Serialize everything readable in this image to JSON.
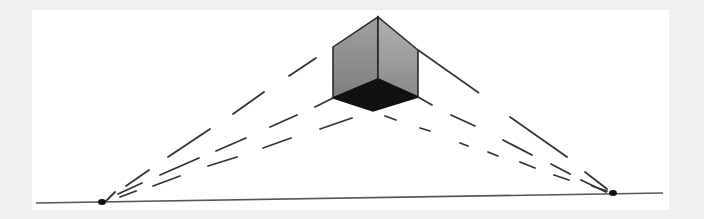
{
  "figure": {
    "background_color": "#efefef",
    "card_color": "#ffffff",
    "horizon_line": {
      "x1": 36,
      "y1": 203,
      "x2": 663,
      "y2": 193
    },
    "vanishing_points": {
      "left": {
        "x": 101,
        "y": 202
      },
      "right": {
        "x": 613,
        "y": 193
      }
    },
    "cube": {
      "top": [
        378,
        17
      ],
      "left_top": [
        333,
        47
      ],
      "right_top": [
        418,
        50
      ],
      "center": [
        378,
        79
      ],
      "left_bottom": [
        333,
        98
      ],
      "right_bottom": [
        418,
        97
      ],
      "bottom": [
        373,
        111
      ],
      "left_face_color": "#8c8c8c",
      "right_face_color": "#9c9c9c",
      "bottom_face_color": "#111111"
    }
  }
}
